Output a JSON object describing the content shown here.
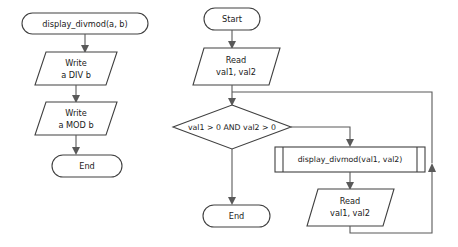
{
  "page": {
    "background_color": "#ffffff",
    "stroke_color": "#404040",
    "connector_color": "#595959",
    "text_color": "#1a1a1a",
    "width": 458,
    "height": 247
  },
  "diagrams": [
    {
      "id": "subprogram",
      "name": "display-divmod-subprogram",
      "nodes": [
        {
          "id": "sub-start",
          "type": "terminator",
          "label": "display_divmod(a, b)"
        },
        {
          "id": "sub-write-div",
          "type": "io",
          "label_line1": "Write",
          "label_line2": "a DIV b"
        },
        {
          "id": "sub-write-mod",
          "type": "io",
          "label_line1": "Write",
          "label_line2": "a MOD b"
        },
        {
          "id": "sub-end",
          "type": "terminator",
          "label": "End"
        }
      ]
    },
    {
      "id": "main",
      "name": "main-program",
      "nodes": [
        {
          "id": "main-start",
          "type": "terminator",
          "label": "Start"
        },
        {
          "id": "main-read-1",
          "type": "io",
          "label_line1": "Read",
          "label_line2": "val1, val2"
        },
        {
          "id": "main-decision",
          "type": "decision",
          "label": "val1 > 0 AND val2 > 0"
        },
        {
          "id": "main-call",
          "type": "subroutine",
          "label": "display_divmod(val1, val2)"
        },
        {
          "id": "main-read-2",
          "type": "io",
          "label_line1": "Read",
          "label_line2": "val1, val2"
        },
        {
          "id": "main-end",
          "type": "terminator",
          "label": "End"
        }
      ]
    }
  ]
}
